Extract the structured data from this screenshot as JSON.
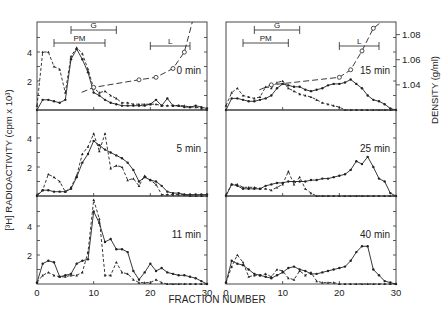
{
  "figure": {
    "y_axis_left_label": "[³H] RADIOACTIVITY (cpm x 10³)",
    "y_axis_right_label": "DENSITY (g/ml)",
    "x_axis_label": "FRACTION NUMBER",
    "x_ticks": [
      "0",
      "10",
      "20",
      "30"
    ],
    "y_ticks_left": [
      "2",
      "4"
    ],
    "y_ticks_right": [
      "1.04",
      "1.06",
      "1.08"
    ],
    "markers": {
      "G": "G",
      "PM": "PM",
      "L": "L"
    }
  },
  "chart_data": [
    {
      "type": "line",
      "panel": "top-left",
      "title": "0 min",
      "xlabel": "FRACTION NUMBER",
      "ylabel": "RADIOACTIVITY (cpm x 10³)",
      "xlim": [
        0,
        30
      ],
      "ylim": [
        0,
        6
      ],
      "series": [
        {
          "name": "dashed",
          "style": "dashed",
          "x": [
            0,
            1,
            2,
            3,
            4,
            5,
            6,
            7,
            8,
            9,
            10,
            11,
            12,
            13,
            14,
            15,
            16,
            17,
            18,
            19,
            20,
            21,
            22,
            23,
            24,
            25,
            26,
            27,
            28,
            29,
            30
          ],
          "values": [
            0.3,
            4.0,
            4.0,
            3.0,
            2.8,
            1.2,
            3.7,
            4.3,
            3.9,
            2.8,
            1.5,
            1.2,
            1.3,
            1.0,
            0.8,
            0.5,
            0.5,
            0.4,
            0.4,
            0.4,
            0.4,
            0.4,
            0.3,
            0.3,
            0.3,
            0.3,
            0.3,
            0.2,
            0.2,
            0.1,
            0.0
          ]
        },
        {
          "name": "solid",
          "style": "solid",
          "x": [
            0,
            1,
            2,
            3,
            4,
            5,
            6,
            7,
            8,
            9,
            10,
            11,
            12,
            13,
            14,
            15,
            16,
            17,
            18,
            19,
            20,
            21,
            22,
            23,
            24,
            25,
            26,
            27,
            28,
            29,
            30
          ],
          "values": [
            0.0,
            0.7,
            0.7,
            0.6,
            0.5,
            0.7,
            3.5,
            4.2,
            3.5,
            2.6,
            1.2,
            1.0,
            0.7,
            0.5,
            0.4,
            0.3,
            0.3,
            0.3,
            0.3,
            0.3,
            0.4,
            0.7,
            0.3,
            0.8,
            0.3,
            0.3,
            0.2,
            0.2,
            0.3,
            0.2,
            0.1
          ]
        }
      ],
      "density": {
        "x": [
          10,
          18,
          21,
          24,
          26
        ],
        "values": [
          1.038,
          1.044,
          1.046,
          1.053,
          1.066
        ]
      },
      "bands": [
        {
          "label": "G",
          "x": [
            6,
            14
          ]
        },
        {
          "label": "PM",
          "x": [
            3,
            12
          ]
        },
        {
          "label": "L",
          "x": [
            20,
            27
          ]
        }
      ]
    },
    {
      "type": "line",
      "panel": "top-right",
      "title": "15 min",
      "xlim": [
        0,
        30
      ],
      "ylim": [
        0,
        6
      ],
      "series": [
        {
          "name": "dashed",
          "style": "dashed",
          "x": [
            0,
            1,
            2,
            3,
            4,
            5,
            6,
            7,
            8,
            9,
            10,
            11,
            12,
            13,
            14,
            15,
            16,
            17,
            18,
            19,
            20,
            21,
            22,
            23,
            24,
            25,
            26,
            27,
            28,
            29,
            30
          ],
          "values": [
            0.3,
            1.2,
            1.5,
            1.0,
            0.9,
            0.8,
            0.9,
            1.6,
            1.5,
            1.9,
            2.0,
            1.5,
            1.3,
            1.1,
            1.0,
            0.9,
            0.7,
            0.5,
            0.4,
            0.3,
            0.2,
            0.0,
            0.0,
            0.0,
            0.0,
            0.0,
            0.0,
            0.0,
            0.0,
            0.0,
            0.0
          ]
        },
        {
          "name": "solid",
          "style": "solid",
          "x": [
            0,
            1,
            2,
            3,
            4,
            5,
            6,
            7,
            8,
            9,
            10,
            11,
            12,
            13,
            14,
            15,
            16,
            17,
            18,
            19,
            20,
            21,
            22,
            23,
            24,
            25,
            26,
            27,
            28,
            29,
            30
          ],
          "values": [
            0.0,
            0.8,
            0.8,
            0.7,
            0.6,
            0.6,
            0.7,
            0.8,
            1.0,
            1.5,
            1.8,
            1.7,
            1.6,
            1.6,
            1.4,
            1.3,
            1.4,
            1.5,
            1.7,
            1.8,
            1.8,
            1.9,
            2.1,
            1.8,
            1.5,
            1.0,
            0.7,
            0.6,
            0.4,
            0.1,
            0.0
          ]
        }
      ],
      "density": {
        "x": [
          8,
          20,
          22,
          24,
          26
        ],
        "values": [
          1.04,
          1.046,
          1.052,
          1.067,
          1.085
        ]
      },
      "bands": [
        {
          "label": "G",
          "x": [
            5,
            13
          ]
        },
        {
          "label": "PM",
          "x": [
            3,
            11
          ]
        },
        {
          "label": "L",
          "x": [
            20,
            27
          ]
        }
      ]
    },
    {
      "type": "line",
      "panel": "middle-left",
      "title": "5 min",
      "xlim": [
        0,
        30
      ],
      "ylim": [
        0,
        6
      ],
      "series": [
        {
          "name": "dashed",
          "style": "dashed",
          "x": [
            0,
            1,
            2,
            3,
            4,
            5,
            6,
            7,
            8,
            9,
            10,
            11,
            12,
            13,
            14,
            15,
            16,
            17,
            18,
            19,
            20,
            21,
            22,
            23,
            24,
            25,
            26,
            27,
            28,
            29,
            30
          ],
          "values": [
            0.1,
            0.4,
            1.5,
            1.3,
            1.0,
            0.3,
            0.6,
            1.4,
            2.9,
            3.4,
            4.3,
            3.1,
            4.3,
            1.9,
            2.1,
            2.0,
            1.1,
            1.2,
            0.7,
            1.4,
            1.1,
            0.8,
            0.1,
            0.1,
            0.1,
            0.1,
            0.1,
            0.0,
            0.0,
            0.0,
            0.0
          ]
        },
        {
          "name": "solid",
          "style": "solid",
          "x": [
            0,
            1,
            2,
            3,
            4,
            5,
            6,
            7,
            8,
            9,
            10,
            11,
            12,
            13,
            14,
            15,
            16,
            17,
            18,
            19,
            20,
            21,
            22,
            23,
            24,
            25,
            26,
            27,
            28,
            29,
            30
          ],
          "values": [
            0.0,
            0.4,
            0.4,
            0.3,
            0.3,
            0.3,
            0.5,
            1.3,
            2.3,
            2.9,
            3.8,
            3.5,
            3.2,
            3.0,
            2.8,
            2.6,
            2.3,
            1.8,
            1.0,
            1.3,
            1.1,
            1.0,
            0.7,
            0.3,
            0.2,
            0.2,
            0.1,
            0.1,
            0.1,
            0.1,
            0.1
          ]
        }
      ]
    },
    {
      "type": "line",
      "panel": "middle-right",
      "title": "25 min",
      "xlim": [
        0,
        30
      ],
      "ylim": [
        0,
        6
      ],
      "series": [
        {
          "name": "dashed",
          "style": "dashed",
          "x": [
            0,
            1,
            2,
            3,
            4,
            5,
            6,
            7,
            8,
            9,
            10,
            11,
            12,
            13,
            14,
            15,
            16,
            17,
            18,
            19,
            20,
            21,
            22,
            23,
            24,
            25,
            26,
            27,
            28,
            29,
            30
          ],
          "values": [
            0.1,
            0.8,
            0.8,
            0.6,
            0.6,
            0.6,
            0.5,
            0.5,
            0.4,
            0.6,
            0.8,
            1.7,
            0.8,
            1.3,
            0.5,
            0.2,
            0.0,
            0.0,
            0.0,
            0.0,
            0.0,
            0.0,
            0.0,
            0.0,
            0.0,
            0.0,
            0.0,
            0.0,
            0.0,
            0.0,
            0.0
          ]
        },
        {
          "name": "solid",
          "style": "solid",
          "x": [
            0,
            1,
            2,
            3,
            4,
            5,
            6,
            7,
            8,
            9,
            10,
            11,
            12,
            13,
            14,
            15,
            16,
            17,
            18,
            19,
            20,
            21,
            22,
            23,
            24,
            25,
            26,
            27,
            28,
            29,
            30
          ],
          "values": [
            0.0,
            0.8,
            0.7,
            0.5,
            0.5,
            0.5,
            0.5,
            0.7,
            0.8,
            0.9,
            0.9,
            1.0,
            1.0,
            1.0,
            1.0,
            1.1,
            1.1,
            1.2,
            1.2,
            1.3,
            1.4,
            1.5,
            1.8,
            2.4,
            2.2,
            2.7,
            2.0,
            1.2,
            1.0,
            0.2,
            0.0
          ]
        }
      ]
    },
    {
      "type": "line",
      "panel": "bottom-left",
      "title": "11 min",
      "xlim": [
        0,
        30
      ],
      "ylim": [
        0,
        6
      ],
      "series": [
        {
          "name": "dashed",
          "style": "dashed",
          "x": [
            0,
            1,
            2,
            3,
            4,
            5,
            6,
            7,
            8,
            9,
            10,
            11,
            12,
            13,
            14,
            15,
            16,
            17,
            18,
            19,
            20,
            21,
            22,
            23,
            24,
            25,
            26,
            27,
            28,
            29,
            30
          ],
          "values": [
            0.1,
            0.6,
            0.8,
            0.6,
            0.5,
            0.5,
            0.6,
            0.6,
            0.8,
            2.2,
            5.8,
            4.5,
            0.6,
            0.6,
            1.5,
            0.8,
            0.7,
            0.3,
            0.1,
            0.1,
            0.1,
            0.3,
            0.1,
            0.0,
            0.0,
            0.0,
            0.0,
            0.0,
            0.0,
            0.0,
            0.0
          ]
        },
        {
          "name": "solid",
          "style": "solid",
          "x": [
            0,
            1,
            2,
            3,
            4,
            5,
            6,
            7,
            8,
            9,
            10,
            11,
            12,
            13,
            14,
            15,
            16,
            17,
            18,
            19,
            20,
            21,
            22,
            23,
            24,
            25,
            26,
            27,
            28,
            29,
            30
          ],
          "values": [
            0.1,
            1.4,
            1.6,
            1.5,
            0.5,
            0.6,
            0.7,
            1.4,
            1.6,
            1.7,
            5.0,
            4.2,
            2.9,
            3.1,
            2.4,
            2.4,
            2.2,
            0.9,
            0.3,
            0.8,
            1.4,
            0.9,
            1.1,
            0.8,
            0.7,
            0.6,
            0.6,
            0.5,
            0.4,
            0.2,
            0.0
          ]
        }
      ]
    },
    {
      "type": "line",
      "panel": "bottom-right",
      "title": "40 min",
      "xlim": [
        0,
        30
      ],
      "ylim": [
        0,
        6
      ],
      "series": [
        {
          "name": "dashed",
          "style": "dashed",
          "x": [
            0,
            1,
            2,
            3,
            4,
            5,
            6,
            7,
            8,
            9,
            10,
            11,
            12,
            13,
            14,
            15,
            16,
            17,
            18,
            19,
            20,
            21,
            22,
            23,
            24,
            25,
            26,
            27,
            28,
            29,
            30
          ],
          "values": [
            0.1,
            1.2,
            2.0,
            1.5,
            0.5,
            0.6,
            0.6,
            0.7,
            0.5,
            1.0,
            0.9,
            0.4,
            0.3,
            0.9,
            0.6,
            0.8,
            0.2,
            0.1,
            0.1,
            0.1,
            0.0,
            0.0,
            0.0,
            0.0,
            0.0,
            0.0,
            0.0,
            0.0,
            0.0,
            0.0,
            0.0
          ]
        },
        {
          "name": "solid",
          "style": "solid",
          "x": [
            0,
            1,
            2,
            3,
            4,
            5,
            6,
            7,
            8,
            9,
            10,
            11,
            12,
            13,
            14,
            15,
            16,
            17,
            18,
            19,
            20,
            21,
            22,
            23,
            24,
            25,
            26,
            27,
            28,
            29,
            30
          ],
          "values": [
            0.1,
            1.6,
            1.4,
            1.3,
            1.0,
            0.7,
            0.6,
            0.5,
            0.4,
            0.6,
            0.8,
            1.1,
            1.2,
            1.0,
            0.9,
            0.7,
            0.7,
            0.8,
            0.9,
            1.0,
            1.1,
            1.2,
            1.6,
            2.2,
            2.6,
            2.6,
            1.0,
            0.6,
            0.2,
            0.1,
            0.0
          ]
        }
      ]
    }
  ]
}
